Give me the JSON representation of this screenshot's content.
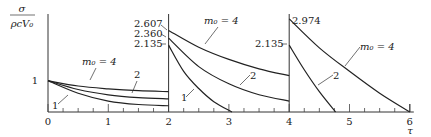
{
  "chart_data": {
    "type": "line",
    "title": "",
    "xlabel": "τ",
    "ylabel": "σ / (ρcV₀)",
    "xlim": [
      0,
      6
    ],
    "ylim": [
      0,
      3.0
    ],
    "x_ticks": [
      "0",
      "1",
      "2",
      "3",
      "4",
      "5",
      "6"
    ],
    "grid": false,
    "legend": "inline curve labels with arrows",
    "series": [
      {
        "name": "m0=4",
        "label": "m₀=4",
        "segments": [
          {
            "x": [
              0,
              0.5,
              1,
              1.5,
              2
            ],
            "y": [
              1.0,
              0.83,
              0.74,
              0.68,
              0.65
            ]
          },
          {
            "x": [
              2,
              2.5,
              3,
              3.5,
              4
            ],
            "y": [
              2.607,
              2.07,
              1.68,
              1.38,
              1.16
            ]
          },
          {
            "x": [
              4,
              4.5,
              5,
              5.5,
              6
            ],
            "y": [
              2.974,
              2.05,
              1.3,
              0.6,
              0.0
            ]
          }
        ]
      },
      {
        "name": "m0=2",
        "label": "2",
        "segments": [
          {
            "x": [
              0,
              0.5,
              1,
              1.5,
              2
            ],
            "y": [
              1.0,
              0.72,
              0.55,
              0.46,
              0.42
            ]
          },
          {
            "x": [
              2,
              2.5,
              3,
              3.5,
              4
            ],
            "y": [
              2.36,
              1.45,
              0.9,
              0.55,
              0.35
            ]
          },
          {
            "x": [
              4,
              4.25,
              4.5,
              4.77
            ],
            "y": [
              2.135,
              1.35,
              0.65,
              0.0
            ]
          }
        ]
      },
      {
        "name": "m0=1",
        "label": "1",
        "segments": [
          {
            "x": [
              0,
              0.5,
              1,
              1.5,
              2
            ],
            "y": [
              1.0,
              0.6,
              0.35,
              0.24,
              0.2
            ]
          },
          {
            "x": [
              2,
              2.25,
              2.5,
              2.75,
              3.05
            ],
            "y": [
              2.135,
              1.3,
              0.75,
              0.33,
              0.0
            ]
          }
        ]
      }
    ],
    "annotations": [
      {
        "text": "2.607",
        "x": 2,
        "y": 2.607
      },
      {
        "text": "2.360",
        "x": 2,
        "y": 2.36
      },
      {
        "text": "2.135",
        "x": 2,
        "y": 2.135
      },
      {
        "text": "2.135",
        "x": 4,
        "y": 2.135
      },
      {
        "text": "2.974",
        "x": 4,
        "y": 2.974
      },
      {
        "text": "1",
        "x": 0,
        "y": 1.0
      }
    ]
  },
  "labels": {
    "y_num": "σ",
    "y_den": "ρcV₀",
    "x_axis": "τ",
    "one": "1",
    "m4": "m₀ = 4",
    "two": "2",
    "v2607": "2.607",
    "v2360": "2.360",
    "v2135a": "2.135",
    "v2135b": "2.135",
    "v2974": "2.974"
  }
}
